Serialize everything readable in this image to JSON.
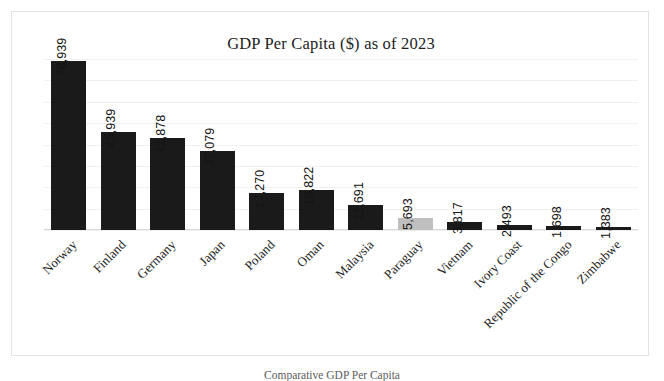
{
  "chart_data": {
    "type": "bar",
    "title": "GDP Per Capita ($) as of 2023",
    "xlabel": "",
    "ylabel": "",
    "ylim": [
      0,
      80000
    ],
    "grid": true,
    "gridline_interval": 10000,
    "legend": "none",
    "axis_tick_labels": "none",
    "label_rotation_values_deg": 90,
    "label_rotation_categories_deg": 45,
    "categories": [
      "Norway",
      "Finland",
      "Germany",
      "Japan",
      "Poland",
      "Oman",
      "Malaysia",
      "Paraguay",
      "Vietnam",
      "Ivory Coast",
      "Republic of the Congo",
      "Zimbabwe"
    ],
    "values": [
      78939,
      45939,
      42878,
      37079,
      17270,
      18822,
      11691,
      5693,
      3817,
      2493,
      1698,
      1383
    ],
    "value_labels": [
      "78,939",
      "45,939",
      "42,878",
      "37,079",
      "17,270",
      "18,822",
      "11,691",
      "5,693",
      "3,817",
      "2,493",
      "1,698",
      "1,383"
    ],
    "highlight_index": 7,
    "colors": {
      "bar": "#1a1a1a",
      "bar_highlight": "#bfbfbf",
      "gridline": "#f0f0f0",
      "axis": "#d8d8d8",
      "text": "#1d1d1d",
      "frame": "#e3e3e3",
      "background": "#ffffff"
    }
  },
  "caption": "Comparative GDP Per Capita"
}
